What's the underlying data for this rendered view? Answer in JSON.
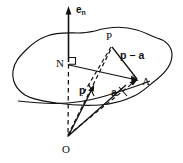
{
  "figure": {
    "background_color": "#ffffff",
    "stroke_color": "#111111",
    "width": 183,
    "height": 163,
    "labels": {
      "axis_normal": "e",
      "axis_normal_sub": "n",
      "point_P": "P",
      "point_N": "N",
      "point_A": "A",
      "point_O": "O",
      "vector_p": "p",
      "vector_a": "a",
      "vector_p_minus_a": "p − a"
    },
    "elements": {
      "surface_name": "irregular-closed-surface",
      "right_angle_marker": "right-angle-square-at-N",
      "dashed_lines": [
        "N-to-O",
        "O-to-P",
        "O-to-A-direction",
        "N-to-P-side"
      ],
      "solid_lines": [
        "e_n-axis",
        "N-to-A",
        "P-to-A",
        "O-to-p-arrow",
        "O-to-a-arrow"
      ]
    }
  }
}
